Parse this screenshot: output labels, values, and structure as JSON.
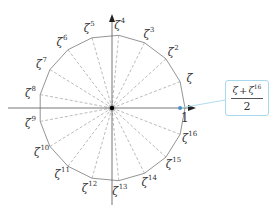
{
  "diagram": {
    "n": 17,
    "center_label": "",
    "real_axis_label": "1",
    "root_symbol": "ζ",
    "labels": [
      {
        "k": 1,
        "base": "ζ",
        "exp": ""
      },
      {
        "k": 2,
        "base": "ζ",
        "exp": "2"
      },
      {
        "k": 3,
        "base": "ζ",
        "exp": "3"
      },
      {
        "k": 4,
        "base": "ζ",
        "exp": "4"
      },
      {
        "k": 5,
        "base": "ζ",
        "exp": "5"
      },
      {
        "k": 6,
        "base": "ζ",
        "exp": "6"
      },
      {
        "k": 7,
        "base": "ζ",
        "exp": "7"
      },
      {
        "k": 8,
        "base": "ζ",
        "exp": "8"
      },
      {
        "k": 9,
        "base": "ζ",
        "exp": "9"
      },
      {
        "k": 10,
        "base": "ζ",
        "exp": "10"
      },
      {
        "k": 11,
        "base": "ζ",
        "exp": "11"
      },
      {
        "k": 12,
        "base": "ζ",
        "exp": "12"
      },
      {
        "k": 13,
        "base": "ζ",
        "exp": "13"
      },
      {
        "k": 14,
        "base": "ζ",
        "exp": "14"
      },
      {
        "k": 15,
        "base": "ζ",
        "exp": "15"
      },
      {
        "k": 16,
        "base": "ζ",
        "exp": "16"
      }
    ],
    "callout": {
      "numerator_a": "ζ",
      "plus": "+",
      "numerator_b": "ζ",
      "numerator_b_exp": "16",
      "denominator": "2"
    },
    "colors": {
      "polygon": "#888888",
      "spokes": "#aaaaaa",
      "axes": "#666666",
      "highlight_point": "#4a90c8",
      "callout_border": "#a8d8ee",
      "center_point": "#000000"
    }
  }
}
